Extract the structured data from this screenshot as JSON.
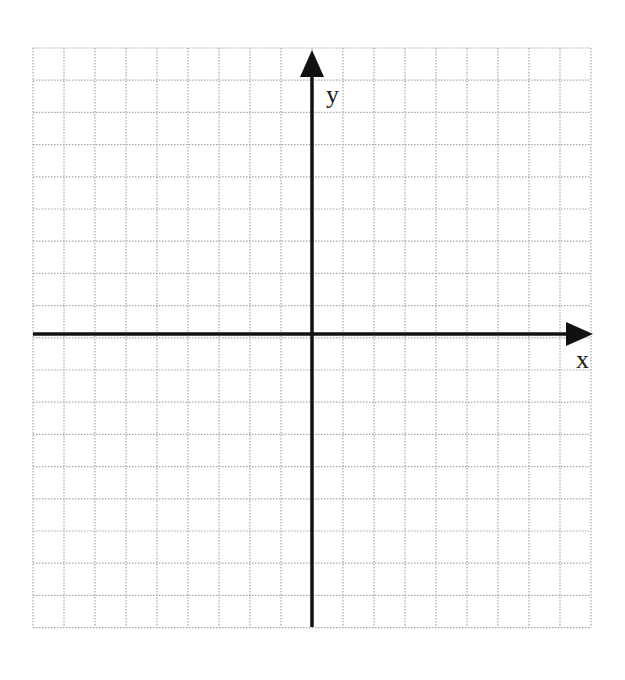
{
  "diagram": {
    "type": "cartesian-coordinate-grid",
    "x_axis_label": "x",
    "y_axis_label": "y",
    "grid": {
      "columns": 18,
      "rows": 18,
      "left": 33,
      "top": 48,
      "cell_width": 31,
      "cell_height": 32.2,
      "line_color": "#a8a8a8",
      "line_style": "dotted"
    },
    "origin": {
      "x": 312,
      "y": 334
    },
    "axis_color": "#111111"
  }
}
